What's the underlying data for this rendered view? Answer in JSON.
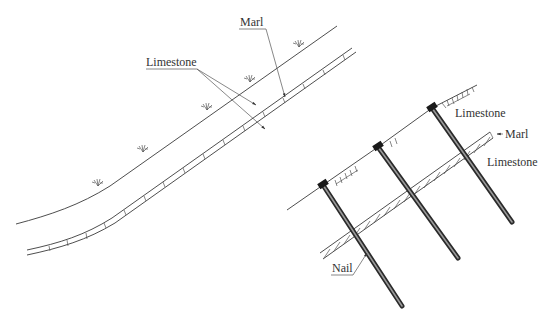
{
  "figure": {
    "left_panel": {
      "description": "Natural slope with thin marl band between limestone layers",
      "labels": {
        "marl": "Marl",
        "limestone": "Limestone"
      },
      "vegetation_symbols": 5
    },
    "right_panel": {
      "description": "Cut slope reinforced with soil nails crossing marl band",
      "labels": {
        "limestone_upper": "Limestone",
        "marl": "Marl",
        "limestone_lower": "Limestone",
        "nail": "Nail"
      },
      "nail_count": 3
    },
    "colors": {
      "line": "#3a3a3a",
      "nail": "#2a2a2a",
      "background": "#ffffff"
    }
  }
}
